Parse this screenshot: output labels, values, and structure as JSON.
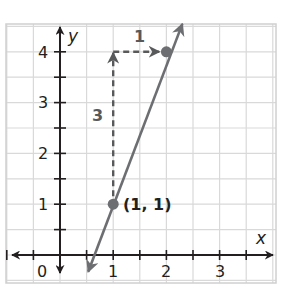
{
  "chart_data": {
    "type": "line",
    "title": "",
    "xlabel": "x",
    "ylabel": "y",
    "xlim": [
      -1,
      4
    ],
    "ylim": [
      -0.3,
      4.5
    ],
    "grid": true,
    "grid_step": 0.5,
    "x_ticks": [
      -1,
      -0.5,
      0,
      0.5,
      1,
      1.5,
      2,
      2.5,
      3,
      3.5
    ],
    "x_tick_labels": [
      {
        "value": 0,
        "label": "0"
      },
      {
        "value": 1,
        "label": "1"
      },
      {
        "value": 2,
        "label": "2"
      },
      {
        "value": 3,
        "label": "3"
      }
    ],
    "y_ticks": [
      0.5,
      1,
      1.5,
      2,
      2.5,
      3,
      3.5,
      4
    ],
    "y_tick_labels": [
      {
        "value": 1,
        "label": "1"
      },
      {
        "value": 2,
        "label": "2"
      },
      {
        "value": 3,
        "label": "3"
      },
      {
        "value": 4,
        "label": "4"
      }
    ],
    "series": [
      {
        "name": "line",
        "slope": 3,
        "intercept": -2,
        "x": [
          0.53,
          2.3
        ],
        "y": [
          -0.33,
          4.55
        ],
        "arrows": "both",
        "color": "#6d6e71"
      }
    ],
    "points": [
      {
        "x": 1,
        "y": 1,
        "label": "(1, 1)"
      },
      {
        "x": 2,
        "y": 4,
        "label": ""
      }
    ],
    "annotations": [
      {
        "type": "dashed-arrow",
        "from": [
          1,
          1
        ],
        "to": [
          1,
          4
        ],
        "label": "3",
        "meaning": "rise"
      },
      {
        "type": "dashed-arrow",
        "from": [
          1,
          4
        ],
        "to": [
          2,
          4
        ],
        "label": "1",
        "meaning": "run"
      }
    ]
  },
  "labels": {
    "x_axis": "x",
    "y_axis": "y",
    "origin": "0",
    "point_label": "(1, 1)",
    "rise_label": "3",
    "run_label": "1",
    "x1": "1",
    "x2": "2",
    "x3": "3",
    "y1": "1",
    "y2": "2",
    "y3": "3",
    "y4": "4"
  },
  "colors": {
    "grid": "#d9d9d9",
    "axis": "#231f20",
    "line": "#6d6e71",
    "dashed": "#58595b",
    "background": "#ffffff"
  }
}
